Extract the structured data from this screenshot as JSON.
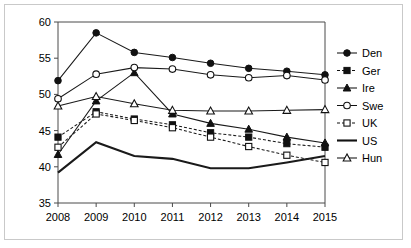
{
  "chart_data": {
    "type": "line",
    "title": "",
    "subtitle": "",
    "xlabel": "",
    "ylabel": "",
    "categories": [
      "2008",
      "2009",
      "2010",
      "2011",
      "2012",
      "2013",
      "2014",
      "2015"
    ],
    "x": [
      2008,
      2009,
      2010,
      2011,
      2012,
      2013,
      2014,
      2015
    ],
    "xlim": [
      2008,
      2015
    ],
    "ylim": [
      35,
      60
    ],
    "yticks": [
      35,
      40,
      45,
      50,
      55,
      60
    ],
    "ytick_labels": [
      "35",
      "40",
      "45",
      "50",
      "55",
      "60"
    ],
    "grid": false,
    "legend_position": "right",
    "series": [
      {
        "name": "Den",
        "values": [
          51.9,
          58.5,
          55.8,
          55.1,
          54.3,
          53.6,
          53.2,
          52.7
        ],
        "marker": "filled-circle",
        "dash": "solid",
        "color": "#111111"
      },
      {
        "name": "Ger",
        "values": [
          44.1,
          47.6,
          46.6,
          45.8,
          44.7,
          44.1,
          43.2,
          42.7
        ],
        "marker": "filled-square",
        "dash": "dashed",
        "color": "#111111"
      },
      {
        "name": "Ire",
        "values": [
          41.7,
          49.1,
          53.0,
          47.3,
          46.0,
          45.2,
          44.1,
          43.3
        ],
        "marker": "filled-triangle",
        "dash": "solid",
        "color": "#111111"
      },
      {
        "name": "Swe",
        "values": [
          49.4,
          52.8,
          53.7,
          53.5,
          52.7,
          52.3,
          52.6,
          52.0
        ],
        "marker": "open-circle",
        "dash": "solid",
        "color": "#111111"
      },
      {
        "name": "UK",
        "values": [
          42.7,
          47.3,
          46.4,
          45.4,
          44.1,
          42.8,
          41.6,
          40.6
        ],
        "marker": "open-square",
        "dash": "dashed",
        "color": "#111111"
      },
      {
        "name": "US",
        "values": [
          39.2,
          43.4,
          41.5,
          41.1,
          39.8,
          39.8,
          40.6,
          41.5
        ],
        "marker": "none",
        "dash": "solid",
        "color": "#111111"
      },
      {
        "name": "Hun",
        "values": [
          48.4,
          49.7,
          48.7,
          47.8,
          47.7,
          47.7,
          47.8,
          47.9
        ],
        "marker": "open-triangle",
        "dash": "solid",
        "color": "#111111"
      }
    ]
  },
  "figure": {
    "border_color": "#c9c9c9",
    "background": "#ffffff",
    "axis_color": "#4a4a4a"
  }
}
